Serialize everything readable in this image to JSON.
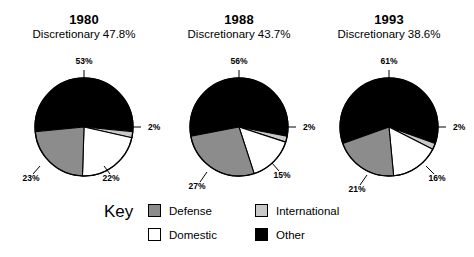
{
  "chart_data": {
    "type": "pie",
    "categories": [
      "Defense",
      "International",
      "Domestic",
      "Other"
    ],
    "colors": {
      "Defense": "#8c8c8c",
      "International": "#c8c8c8",
      "Domestic": "#ffffff",
      "Other": "#000000",
      "outline": "#000000",
      "background": "#ffffff"
    },
    "legend_position": "bottom",
    "grid": false,
    "panels": [
      {
        "title": "1980",
        "subtitle": "Discretionary 47.8%",
        "slices": [
          {
            "label": "Other",
            "value": 53,
            "value_label": "53%"
          },
          {
            "label": "International",
            "value": 2,
            "value_label": "2%"
          },
          {
            "label": "Domestic",
            "value": 22,
            "value_label": "22%"
          },
          {
            "label": "Defense",
            "value": 23,
            "value_label": "23%"
          }
        ]
      },
      {
        "title": "1988",
        "subtitle": "Discretionary 43.7%",
        "slices": [
          {
            "label": "Other",
            "value": 56,
            "value_label": "56%"
          },
          {
            "label": "International",
            "value": 2,
            "value_label": "2%"
          },
          {
            "label": "Domestic",
            "value": 15,
            "value_label": "15%"
          },
          {
            "label": "Defense",
            "value": 27,
            "value_label": "27%"
          }
        ]
      },
      {
        "title": "1993",
        "subtitle": "Discretionary 38.6%",
        "slices": [
          {
            "label": "Other",
            "value": 61,
            "value_label": "61%"
          },
          {
            "label": "International",
            "value": 2,
            "value_label": "2%"
          },
          {
            "label": "Domestic",
            "value": 16,
            "value_label": "16%"
          },
          {
            "label": "Defense",
            "value": 21,
            "value_label": "21%"
          }
        ]
      }
    ]
  },
  "key": {
    "heading": "Key",
    "entries": [
      {
        "label": "Defense",
        "color": "#8c8c8c"
      },
      {
        "label": "International",
        "color": "#c8c8c8"
      },
      {
        "label": "Domestic",
        "color": "#ffffff"
      },
      {
        "label": "Other",
        "color": "#000000"
      }
    ]
  }
}
